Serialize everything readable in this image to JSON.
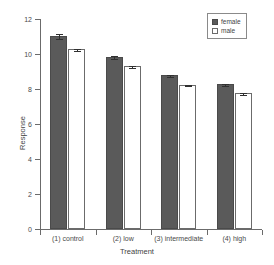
{
  "chart_data": {
    "type": "bar",
    "title": "",
    "xlabel": "Treatment",
    "ylabel": "Response",
    "categories": [
      "(1) control",
      "(2) low",
      "(3) intermediate",
      "(4) high"
    ],
    "series": [
      {
        "name": "female",
        "color": "#5a5a5a",
        "values": [
          11.0,
          9.8,
          8.75,
          8.25
        ],
        "errors": [
          0.12,
          0.06,
          0.06,
          0.05
        ]
      },
      {
        "name": "male",
        "color": "#ffffff",
        "values": [
          10.25,
          9.25,
          8.2,
          7.7
        ],
        "errors": [
          0.06,
          0.05,
          0.05,
          0.06
        ]
      }
    ],
    "ylim": [
      0,
      12
    ],
    "yticks": [
      0,
      2,
      4,
      6,
      8,
      10,
      12
    ],
    "ytick_labels": [
      "0",
      "2",
      "4",
      "6",
      "8",
      "10",
      "12"
    ],
    "grid": false,
    "legend_position": "top-right",
    "legend_entries": [
      "female",
      "male"
    ],
    "error_bar_style": "t-cap"
  },
  "legend": {
    "items": [
      {
        "label": "female",
        "swatch": "filled-square-icon"
      },
      {
        "label": "male",
        "swatch": "open-square-icon"
      }
    ]
  },
  "axes": {
    "y_title": "Response",
    "x_title": "Treatment"
  }
}
